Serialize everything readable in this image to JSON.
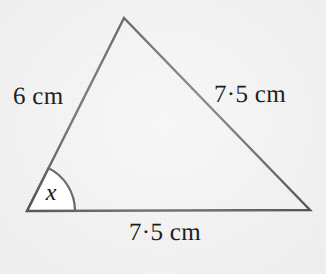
{
  "figure": {
    "kind": "geometry-diagram",
    "shape": "triangle",
    "background_color": "#f1f1f1",
    "stroke_color": "#2b2b2b",
    "angle_fill_color": "#ffffff"
  },
  "labels": {
    "left_side": "6 cm",
    "right_side": "7·5 cm",
    "base": "7·5 cm",
    "angle": "x"
  },
  "geometry": {
    "apex": {
      "x": 124,
      "y": 18
    },
    "bottom_left": {
      "x": 27,
      "y": 211
    },
    "bottom_right": {
      "x": 310,
      "y": 210
    },
    "angle_arc_radius": 48,
    "stroke_width": 2.4
  },
  "chart_data": {
    "type": "diagram",
    "title": "",
    "sides": [
      {
        "name": "left-side",
        "from": "bottom-left",
        "to": "apex",
        "label": "6 cm",
        "value": 6,
        "unit": "cm"
      },
      {
        "name": "right-side",
        "from": "apex",
        "to": "bottom-right",
        "label": "7·5 cm",
        "value": 7.5,
        "unit": "cm"
      },
      {
        "name": "base",
        "from": "bottom-left",
        "to": "bottom-right",
        "label": "7·5 cm",
        "value": 7.5,
        "unit": "cm"
      }
    ],
    "angles": [
      {
        "name": "x",
        "at": "bottom-left",
        "label": "x",
        "marked": true
      }
    ]
  }
}
